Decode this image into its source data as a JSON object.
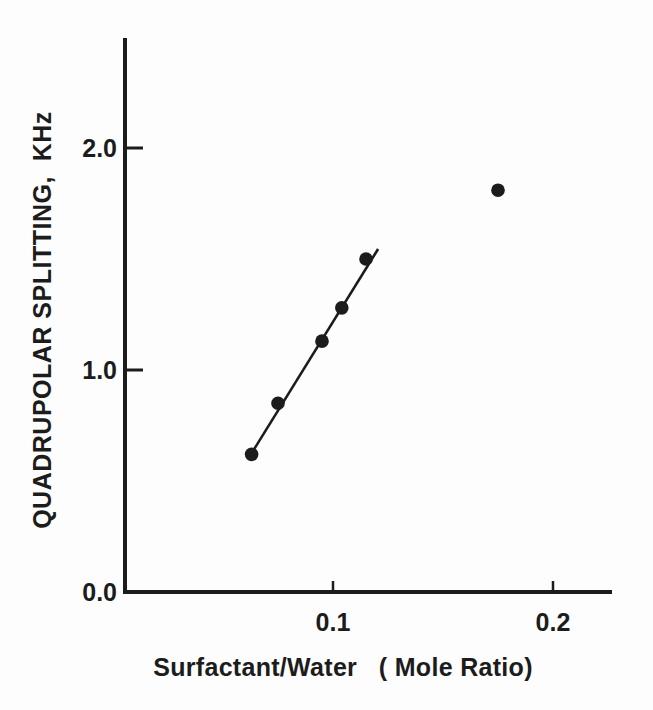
{
  "figure": {
    "background": "#fdfdfd",
    "ink_color": "#1c1c1c"
  },
  "chart_data": {
    "type": "scatter",
    "title": "",
    "xlabel": "Surfactant/Water   ( Mole Ratio)",
    "ylabel": "QUADRUPOLAR SPLITTING,  KHz",
    "xlim": [
      0,
      0.225
    ],
    "ylim": [
      0,
      2.5
    ],
    "grid": false,
    "legend": null,
    "x_ticks": [
      {
        "value": 0.1,
        "label": "0.1"
      },
      {
        "value": 0.2,
        "label": "0.2"
      }
    ],
    "y_ticks": [
      {
        "value": 0.0,
        "label": "0.0"
      },
      {
        "value": 1.0,
        "label": "1.0"
      },
      {
        "value": 2.0,
        "label": "2.0"
      }
    ],
    "series": [
      {
        "name": "linear-region-points",
        "marker": "filled-circle",
        "has_line": true,
        "points": [
          {
            "x": 0.063,
            "y": 0.62
          },
          {
            "x": 0.075,
            "y": 0.85
          },
          {
            "x": 0.095,
            "y": 1.13
          },
          {
            "x": 0.104,
            "y": 1.28
          },
          {
            "x": 0.115,
            "y": 1.5
          }
        ]
      },
      {
        "name": "outlier-point",
        "marker": "filled-circle",
        "has_line": false,
        "points": [
          {
            "x": 0.175,
            "y": 1.81
          }
        ]
      }
    ],
    "fit_line": {
      "x1": 0.063,
      "y1": 0.625,
      "x2": 0.1205,
      "y2": 1.545
    }
  }
}
